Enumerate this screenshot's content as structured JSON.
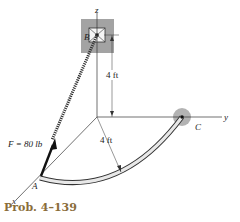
{
  "figure": {
    "caption": "Prob. 4–139",
    "axes": {
      "x": "x",
      "y": "y",
      "z": "z"
    },
    "points": {
      "A": "A",
      "B": "B",
      "C": "C"
    },
    "force_label": "F = 80 lb",
    "dimensions": {
      "height": "4 ft",
      "radius": "4 ft"
    },
    "colors": {
      "support_gray": "#9a9a9a",
      "caption": "#8a6d3a",
      "line": "#222222"
    }
  }
}
